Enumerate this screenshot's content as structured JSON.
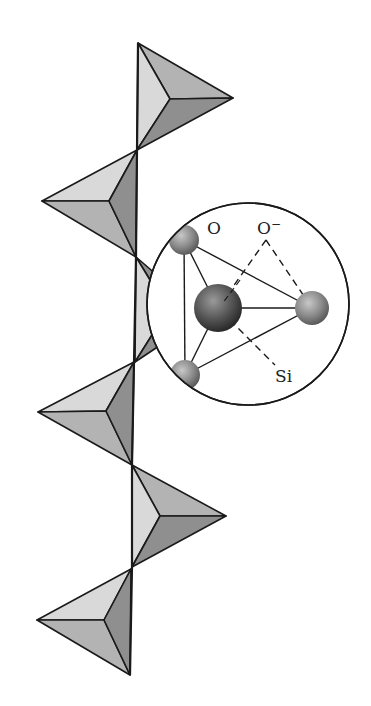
{
  "figure": {
    "colors": {
      "background": "#ffffff",
      "outline": "#1a1a1a",
      "face_light": "#d9d9d9",
      "face_mid": "#b3b3b3",
      "face_dark": "#8f8f8f",
      "atom_o": "#8a8a8a",
      "atom_si": "#555555"
    }
  },
  "inset": {
    "labels": {
      "oxygen": "O",
      "oxygen_anion": "O",
      "oxygen_anion_charge": "−",
      "silicon": "Si"
    }
  }
}
